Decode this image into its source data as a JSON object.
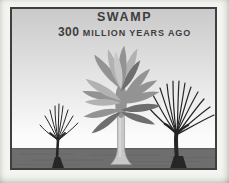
{
  "figure": {
    "title": "SWAMP",
    "subtitle": {
      "number": "300",
      "text": "MILLION YEARS AGO"
    }
  },
  "scene": {
    "elements": [
      "swamp-sky",
      "swamp-ground",
      "left-bare-tree",
      "tree-fern",
      "right-bare-tree"
    ]
  },
  "colors": {
    "page_background": "#f4f4f1",
    "frame_border": "#3f3f3f",
    "text": "#3d3d3d",
    "sky_top": "#cacaca",
    "sky_bottom": "#fbfbfb",
    "ground": "#6e6e6e",
    "ground_shadow": "#565656",
    "bare_tree": "#262626",
    "trunk_light": "#c8c8c8",
    "trunk_edge": "#999999",
    "leaf_dark": "#6e6e6e",
    "leaf_mid": "#939393",
    "leaf_light": "#b2b2b2",
    "leaf_lighter": "#c8c8c8"
  }
}
